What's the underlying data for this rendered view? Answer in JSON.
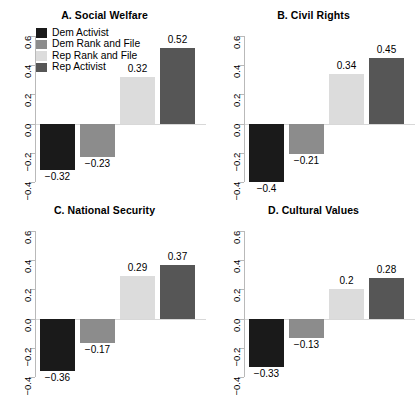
{
  "chart_data": {
    "type": "bar",
    "title": "",
    "xlabel": "",
    "ylabel": "",
    "ylim": [
      -0.4,
      0.6
    ],
    "yticks": [
      0.6,
      0.4,
      0.2,
      0.0,
      -0.2,
      -0.4
    ],
    "ytick_labels": [
      "0.6",
      "0.4",
      "0.2",
      "0.0",
      "-0.2",
      "-0.4"
    ],
    "grid": false,
    "legend_position": "top-left of panel A",
    "categories": [
      "Dem Activist",
      "Dem Rank and File",
      "Rep Rank and File",
      "Rep Activist"
    ],
    "colors": [
      "#1a1a1a",
      "#8c8c8c",
      "#dcdcdc",
      "#565656"
    ],
    "panels": [
      {
        "key": "a",
        "title": "A. Social Welfare",
        "values": [
          -0.32,
          -0.23,
          0.32,
          0.52
        ],
        "labels": [
          "-0.32",
          "-0.23",
          "0.32",
          "0.52"
        ]
      },
      {
        "key": "b",
        "title": "B. Civil Rights",
        "values": [
          -0.4,
          -0.21,
          0.34,
          0.45
        ],
        "labels": [
          "-0.4",
          "-0.21",
          "0.34",
          "0.45"
        ]
      },
      {
        "key": "c",
        "title": "C. National Security",
        "values": [
          -0.36,
          -0.17,
          0.29,
          0.37
        ],
        "labels": [
          "-0.36",
          "-0.17",
          "0.29",
          "0.37"
        ]
      },
      {
        "key": "d",
        "title": "D. Cultural Values",
        "values": [
          -0.33,
          -0.13,
          0.2,
          0.28
        ],
        "labels": [
          "-0.33",
          "-0.13",
          "0.2",
          "0.28"
        ]
      }
    ],
    "legend": [
      {
        "label": "Dem Activist",
        "color": "#1a1a1a"
      },
      {
        "label": "Dem Rank and File",
        "color": "#8c8c8c"
      },
      {
        "label": "Rep Rank and File",
        "color": "#dcdcdc"
      },
      {
        "label": "Rep Activist",
        "color": "#565656"
      }
    ]
  }
}
